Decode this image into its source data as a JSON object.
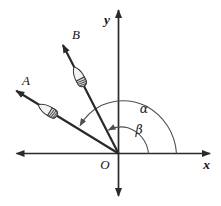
{
  "axes": {
    "x_label": "x",
    "y_label": "y",
    "origin_label": "O"
  },
  "rays": [
    {
      "label": "A"
    },
    {
      "label": "B"
    }
  ],
  "angles": [
    {
      "label": "α"
    },
    {
      "label": "β"
    }
  ],
  "colors": {
    "ink": "#2a2a2a",
    "arc": "#4f4f4f",
    "background": "#ffffff",
    "rocket_body": "#f3f3f3",
    "rocket_tail": "#d9d9d9"
  }
}
